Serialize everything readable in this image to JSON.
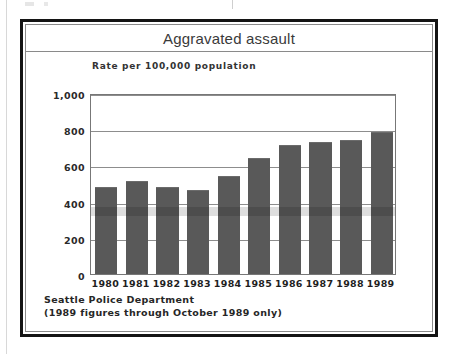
{
  "figure": {
    "title": "Aggravated assault",
    "source_lines": [
      "Seattle Police Department",
      "(1989 figures through October 1989 only)"
    ]
  },
  "colors": {
    "bar_fill": "#595959",
    "frame": "#141414",
    "gridline": "#8d8d8d",
    "title_text": "#3a3a3a",
    "label_text": "#1f1f1f",
    "background": "#ffffff"
  },
  "chart_data": {
    "type": "bar",
    "title": "Aggravated assault",
    "subtitle": "Rate per 100,000 population",
    "xlabel": "",
    "ylabel": "Rate per 100,000 population",
    "categories": [
      "1980",
      "1981",
      "1982",
      "1983",
      "1984",
      "1985",
      "1986",
      "1987",
      "1988",
      "1989"
    ],
    "values": [
      481,
      513,
      481,
      464,
      540,
      643,
      711,
      731,
      738,
      785
    ],
    "ylim": [
      0,
      1000
    ],
    "yticks": [
      0,
      200,
      400,
      600,
      800,
      1000
    ],
    "ytick_labels": [
      "0",
      "200",
      "400",
      "600",
      "800",
      "1,000"
    ],
    "grid": true,
    "legend": "none",
    "annotations": [
      "Seattle Police Department",
      "(1989 figures through October 1989 only)"
    ]
  }
}
